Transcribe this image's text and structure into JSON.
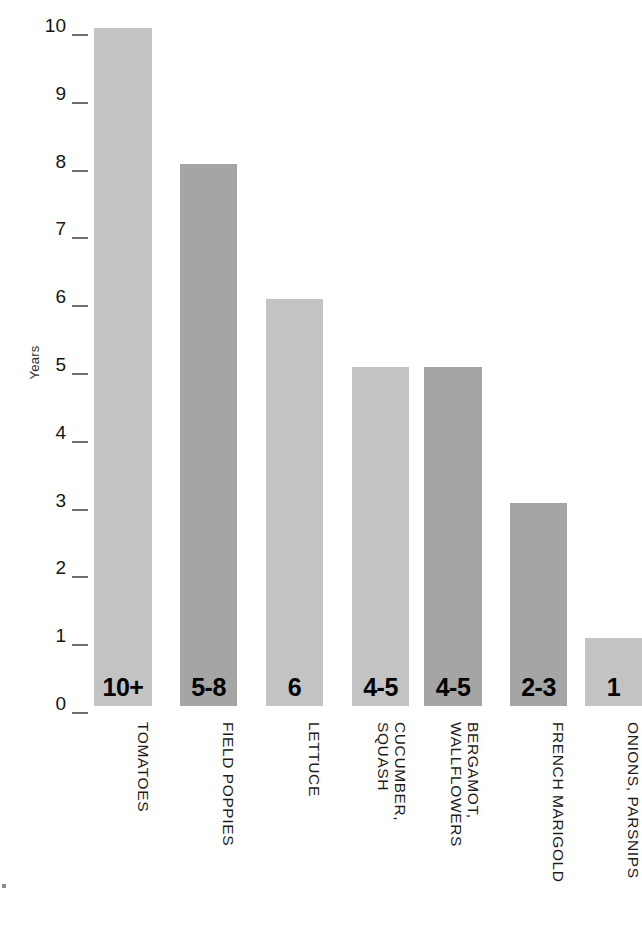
{
  "chart_data": {
    "type": "bar",
    "title": "",
    "subtitle": "",
    "xlabel": "",
    "ylabel": "Years",
    "ylim": [
      0,
      10
    ],
    "yticks": [
      0,
      1,
      2,
      3,
      4,
      5,
      6,
      7,
      8,
      9,
      10
    ],
    "ytick_labels": [
      "0",
      "1",
      "2",
      "3",
      "4",
      "5",
      "6",
      "7",
      "8",
      "9",
      "10"
    ],
    "grid": false,
    "legend": null,
    "orientation": "vertical",
    "categories": [
      "TOMATOES",
      "FIELD POPPIES",
      "LETTUCE",
      "CUCUMBER, SQUASH",
      "BERGAMOT, WALLFLOWERS",
      "FRENCH MARIGOLD",
      "ONIONS, PARSNIPS"
    ],
    "values": [
      10,
      8,
      6,
      5,
      5,
      3,
      1
    ],
    "data_labels": [
      "10+",
      "5-8",
      "6",
      "4-5",
      "4-5",
      "2-3",
      "1"
    ],
    "bars": [
      {
        "category": "TOMATOES",
        "category_lines": [
          "TOMATOES"
        ],
        "value": 10,
        "label": "10+",
        "color": "#c3c3c3",
        "x": 94,
        "width": 58
      },
      {
        "category": "FIELD POPPIES",
        "category_lines": [
          "FIELD POPPIES"
        ],
        "value": 8,
        "label": "5-8",
        "color": "#a5a5a5",
        "x": 180,
        "width": 57
      },
      {
        "category": "LETTUCE",
        "category_lines": [
          "LETTUCE"
        ],
        "value": 6,
        "label": "6",
        "color": "#c3c3c3",
        "x": 266,
        "width": 57
      },
      {
        "category": "CUCUMBER, SQUASH",
        "category_lines": [
          "CUCUMBER,",
          "SQUASH"
        ],
        "value": 5,
        "label": "4-5",
        "color": "#c3c3c3",
        "x": 352,
        "width": 57
      },
      {
        "category": "BERGAMOT, WALLFLOWERS",
        "category_lines": [
          "BERGAMOT,",
          "WALLFLOWERS"
        ],
        "value": 5,
        "label": "4-5",
        "color": "#a5a5a5",
        "x": 424,
        "width": 58
      },
      {
        "category": "FRENCH MARIGOLD",
        "category_lines": [
          "FRENCH MARIGOLD"
        ],
        "value": 3,
        "label": "2-3",
        "color": "#a5a5a5",
        "x": 510,
        "width": 57
      },
      {
        "category": "ONIONS, PARSNIPS",
        "category_lines": [
          "ONIONS, PARSNIPS"
        ],
        "value": 1,
        "label": "1",
        "color": "#c3c3c3",
        "x": 585,
        "width": 57
      }
    ],
    "colors": {
      "bar_light": "#c3c3c3",
      "bar_dark": "#a5a5a5",
      "text": "#141414",
      "tick": "#6e6e6e",
      "background": "#ffffff"
    },
    "geometry": {
      "plot_top_px": 28,
      "baseline_px": 706,
      "unit_px": 67.8,
      "category_label_top_px": 722
    }
  }
}
